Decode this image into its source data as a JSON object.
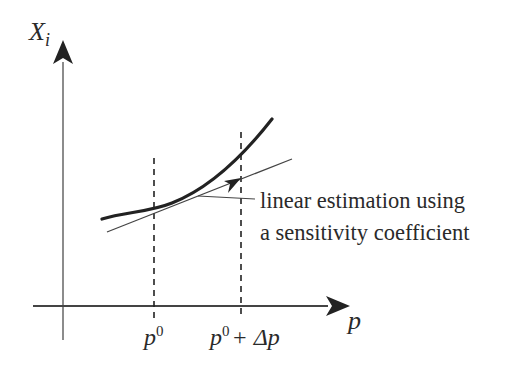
{
  "diagram": {
    "y_axis": {
      "label_main": "X",
      "label_sub": "i"
    },
    "x_axis": {
      "label": "p"
    },
    "ticks": {
      "p0": {
        "base": "p",
        "sup": "0"
      },
      "p0_plus_dp": {
        "base": "p",
        "sup": "0",
        "rest": "+ Δp"
      }
    },
    "annotation": {
      "line1": "linear estimation using",
      "line2": "a sensitivity coefficient"
    },
    "colors": {
      "ink": "#2a2a2a",
      "axis": "#555555",
      "curve": "#222222",
      "background": "#ffffff"
    }
  }
}
